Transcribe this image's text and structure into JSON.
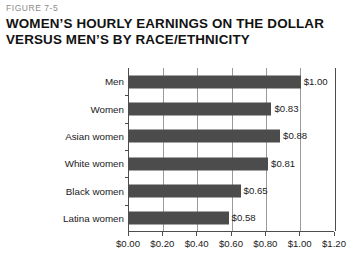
{
  "figure": {
    "number": "FIGURE 7-5",
    "title_line_1": "WOMEN’S HOURLY EARNINGS ON THE DOLLAR",
    "title_line_2": "VERSUS MEN’S BY RACE/ETHNICITY"
  },
  "colors": {
    "bar": "#4c4c4c",
    "axis": "#4d4d4d",
    "gridline": "#9a9a9a",
    "title": "#121212",
    "figure_number": "#8a8a8a",
    "plot_background": "#ffffff"
  },
  "chart_data": {
    "type": "bar",
    "orientation": "horizontal",
    "title": "WOMEN’S HOURLY EARNINGS ON THE DOLLAR VERSUS MEN’S BY RACE/ETHNICITY",
    "subtitle": "FIGURE 7-5",
    "xlabel": "",
    "ylabel": "",
    "categories": [
      "Men",
      "Women",
      "Asian women",
      "White women",
      "Black women",
      "Latina women"
    ],
    "values": [
      1.0,
      0.83,
      0.88,
      0.81,
      0.65,
      0.58
    ],
    "data_labels": [
      "$1.00",
      "$0.83",
      "$0.88",
      "$0.81",
      "$0.65",
      "$0.58"
    ],
    "xlim": [
      0.0,
      1.2
    ],
    "xticks": [
      0.0,
      0.2,
      0.4,
      0.6,
      0.8,
      1.0,
      1.2
    ],
    "xtick_labels": [
      "$0.00",
      "$0.20",
      "$0.40",
      "$0.60",
      "$0.80",
      "$1.00",
      "$1.20"
    ],
    "grid": true,
    "grid_axis": "x",
    "legend": false,
    "legend_position": "none"
  }
}
